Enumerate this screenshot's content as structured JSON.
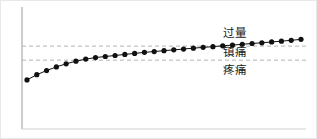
{
  "chart_data": {
    "type": "line",
    "title": "",
    "xlabel": "",
    "ylabel": "",
    "grid": false,
    "legend_position": "inline-right",
    "xlim": [
      0,
      30
    ],
    "ylim": [
      0,
      10
    ],
    "series": [
      {
        "name": "drug-concentration-curve",
        "marker": "filled-circle",
        "color": "#111111",
        "x": [
          1,
          2,
          3,
          4,
          5,
          6,
          7,
          8,
          9,
          10,
          11,
          12,
          13,
          14,
          15,
          16,
          17,
          18,
          19,
          20,
          21,
          22,
          23,
          24,
          25,
          26,
          27,
          28,
          29
        ],
        "y": [
          3.95,
          4.45,
          4.85,
          5.2,
          5.5,
          5.75,
          5.95,
          6.1,
          6.2,
          6.3,
          6.4,
          6.5,
          6.6,
          6.68,
          6.76,
          6.84,
          6.92,
          7.0,
          7.08,
          7.15,
          7.23,
          7.3,
          7.38,
          7.45,
          7.52,
          7.6,
          7.68,
          7.76,
          7.85
        ]
      }
    ],
    "threshold_lines": [
      {
        "name": "overdose-threshold",
        "y": 7.2,
        "style": "dashed",
        "color": "#b4b4b4"
      },
      {
        "name": "pain-threshold",
        "y": 5.85,
        "style": "dashed",
        "color": "#b4b4b4"
      }
    ],
    "zone_labels": [
      {
        "id": "overdose",
        "text": "过量"
      },
      {
        "id": "analgesia",
        "text": "镇痛"
      },
      {
        "id": "pain",
        "text": "疼痛"
      }
    ],
    "axes": {
      "y_axis_color": "#9a9a9a",
      "x_axis_color": "#d0d0d0",
      "show_ticks": false,
      "show_tick_labels": false
    }
  },
  "colors": {
    "curve": "#111111",
    "threshold": "#b4b4b4",
    "y_axis": "#9a9a9a",
    "x_axis": "#d0d0d0",
    "border": "#e8e8e8",
    "background": "#ffffff",
    "label_text": "#1a1a1a"
  }
}
